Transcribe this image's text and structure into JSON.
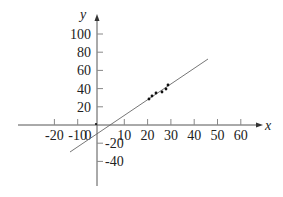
{
  "chart_data": {
    "type": "scatter",
    "title": "",
    "xlabel": "x",
    "ylabel": "y",
    "xlim": [
      -27,
      67
    ],
    "ylim": [
      -50,
      110
    ],
    "grid": false,
    "legend": null,
    "x_ticks": [
      -20,
      -10,
      0,
      10,
      20,
      30,
      40,
      50,
      60
    ],
    "x_tick_labels": [
      "-20",
      "-10",
      "0",
      "10",
      "20",
      "30",
      "40",
      "50",
      "60"
    ],
    "y_ticks": [
      -40,
      -20,
      20,
      40,
      60,
      80,
      100
    ],
    "y_tick_labels": [
      "-40",
      "-20",
      "20",
      "40",
      "60",
      "80",
      "100"
    ],
    "series": [
      {
        "name": "data points",
        "kind": "scatter",
        "x": [
          20.6,
          21.9,
          23.6,
          26.2,
          27.9,
          28.8
        ],
        "y": [
          28.5,
          32,
          35,
          36,
          39.5,
          44
        ]
      },
      {
        "name": "regression line",
        "kind": "line",
        "x": [
          -13,
          46
        ],
        "y": [
          -30,
          72
        ]
      }
    ],
    "annotations": [
      {
        "text": "origin dot",
        "x": 0,
        "y": 0
      }
    ]
  },
  "axes": {
    "x_label": "x",
    "y_label": "y"
  }
}
